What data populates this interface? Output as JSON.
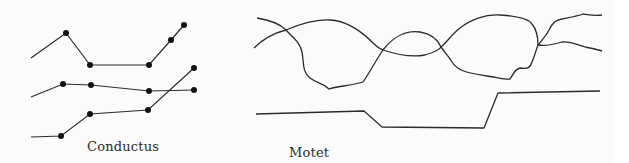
{
  "diagrams": [
    {
      "label": "Conductus",
      "description": "Three voices moving in rhythmic unison; notes shown as dots connected by lines",
      "voices": [
        {
          "name": "voice-top",
          "start": [
            31,
            58
          ],
          "notes": [
            [
              66,
              33
            ],
            [
              90,
              65
            ],
            [
              149,
              65
            ],
            [
              171,
              40
            ],
            [
              184,
              25
            ]
          ]
        },
        {
          "name": "voice-middle",
          "start": [
            31,
            97
          ],
          "notes": [
            [
              63,
              84
            ],
            [
              91,
              85
            ],
            [
              149,
              91
            ],
            [
              194,
              90
            ]
          ]
        },
        {
          "name": "voice-bottom",
          "start": [
            31,
            137
          ],
          "notes": [
            [
              61,
              136
            ],
            [
              90,
              114
            ],
            [
              148,
              110
            ],
            [
              194,
              68
            ]
          ]
        }
      ]
    },
    {
      "label": "Motet",
      "description": "Independent upper voices as interweaving curves over a slow tenor line",
      "voices": [
        {
          "name": "upper-voice-1",
          "path": "M257,18 C270,20 280,24 286,30 C292,37 300,42 302,52 C304,62 302,72 310,78 C318,84 322,82 329,89 C338,86 350,86 363,82 C370,72 376,60 383,50 C392,38 405,30 420,32 C432,34 438,40 441,47 C446,54 450,58 452,62 C458,72 470,73 487,76 C500,78 505,80 510,79 C514,73 515,69 520,68 C528,69 530,68 532,62 C535,55 536,50 538,45 C542,40 546,36 549,30 C553,22 556,20 562,19 C572,17 578,16 583,14 C590,15 595,16 602,15"
        },
        {
          "name": "upper-voice-2",
          "path": "M254,48 C262,40 274,33 286,30 C300,24 315,19 330,20 C348,21 362,32 372,42 C376,46 380,49 383,50 C395,54 410,58 425,55 C435,52 440,49 441,47 C447,42 452,34 460,28 C470,20 485,14 500,15 C515,16 528,18 532,24 C537,30 538,38 538,45 C544,46 552,45 562,42 C572,41 582,47 590,48 C595,49 598,50 602,51"
        },
        {
          "name": "tenor",
          "points": [
            [
              256,
              114
            ],
            [
              364,
              111
            ],
            [
              382,
              127
            ],
            [
              484,
              128
            ],
            [
              498,
              93
            ],
            [
              600,
              91
            ]
          ]
        }
      ]
    }
  ],
  "colors": {
    "ink": "#2b2b2b",
    "background": "#fbfbfb"
  }
}
